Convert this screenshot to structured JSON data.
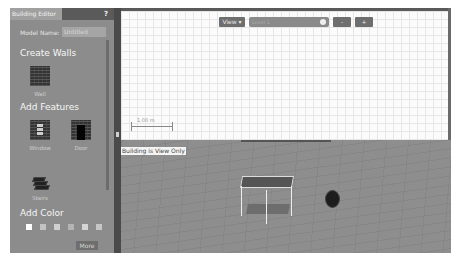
{
  "panel": {
    "title": "Building Editor",
    "help_label": "?",
    "model_name_label": "Model Name:",
    "model_name_value": "Untitled",
    "sections": {
      "create_walls": "Create Walls",
      "add_features": "Add Features",
      "add_color": "Add Color"
    },
    "items": {
      "wall": "Wall",
      "window": "Window",
      "door": "Door",
      "stairs": "Stairs"
    },
    "colors": [
      "#ffffff",
      "#c2c2c2",
      "#cfcfcf",
      "#b4b4b4",
      "#d4d4d4",
      "#c6c6c6"
    ],
    "more_label": "More"
  },
  "toolbar": {
    "view_label": "View ▾",
    "level_value": "Level 1",
    "minus_label": "-",
    "plus_label": "+"
  },
  "editor2d": {
    "scale_label": "1.00 m"
  },
  "view3d": {
    "status_label": "Building is View Only"
  }
}
